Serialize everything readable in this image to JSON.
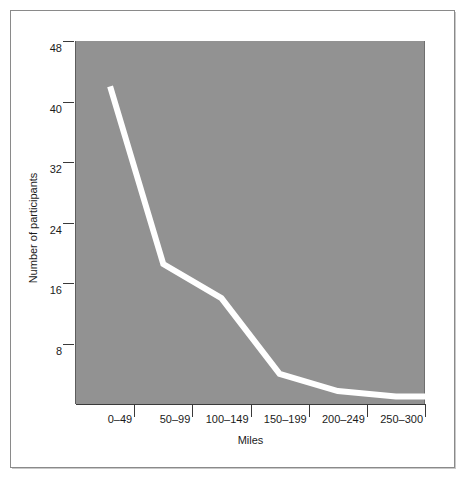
{
  "chart_data": {
    "type": "line",
    "title": "",
    "subtitle": "",
    "xlabel": "Miles",
    "ylabel": "Number of participants",
    "categories": [
      "0–49",
      "50–99",
      "100–149",
      "150–199",
      "200–249",
      "250–300"
    ],
    "values": [
      42,
      18.5,
      14,
      4,
      1.7,
      1
    ],
    "series": [
      {
        "name": "Number of participants",
        "values": [
          42,
          18.5,
          14,
          4,
          1.7,
          1
        ]
      }
    ],
    "ytick_labels": [
      "48",
      "40",
      "32",
      "24",
      "16",
      "8"
    ],
    "ytick_values": [
      48,
      40,
      32,
      24,
      16,
      8
    ],
    "ylim": [
      0,
      48
    ],
    "grid": false,
    "legend": false,
    "legend_position": "none",
    "line_color": "#ffffff",
    "plot_background": "#929292",
    "page_background": "#ffffff",
    "axis_color": "#3a3a3a",
    "text_color": "#1b1b1b",
    "frame_color": "#8a8a8a"
  }
}
